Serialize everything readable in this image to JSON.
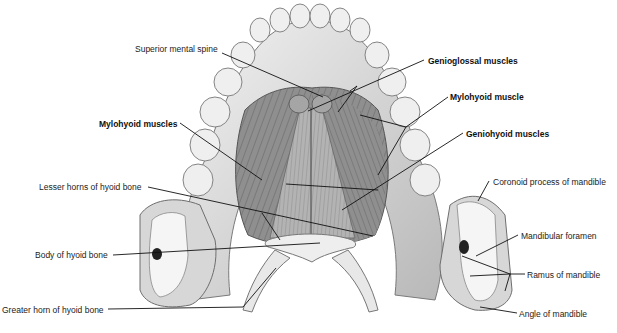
{
  "figure": {
    "labels": [
      {
        "id": "superior-mental-spine",
        "text": "Superior mental spine",
        "bold": false,
        "x": 135,
        "y": 44
      },
      {
        "id": "genioglossal-muscles",
        "text": "Genioglossal muscles",
        "bold": true,
        "x": 428,
        "y": 56
      },
      {
        "id": "mylohyoid-muscle",
        "text": "Mylohyoid muscle",
        "bold": true,
        "x": 450,
        "y": 92
      },
      {
        "id": "mylohyoid-muscles",
        "text": "Mylohyoid muscles",
        "bold": true,
        "x": 99,
        "y": 119
      },
      {
        "id": "geniohyoid-muscles",
        "text": "Geniohyoid muscles",
        "bold": true,
        "x": 466,
        "y": 129
      },
      {
        "id": "lesser-horns-hyoid",
        "text": "Lesser horns of hyoid bone",
        "bold": false,
        "x": 39,
        "y": 182
      },
      {
        "id": "coronoid-process",
        "text": "Coronoid process of mandible",
        "bold": false,
        "x": 493,
        "y": 177
      },
      {
        "id": "mandibular-foramen",
        "text": "Mandibular foramen",
        "bold": false,
        "x": 521,
        "y": 231
      },
      {
        "id": "body-hyoid",
        "text": "Body of hyoid bone",
        "bold": false,
        "x": 35,
        "y": 250
      },
      {
        "id": "ramus-mandible",
        "text": "Ramus of mandible",
        "bold": false,
        "x": 527,
        "y": 270
      },
      {
        "id": "greater-horn-hyoid",
        "text": "Greater horn of hyoid bone",
        "bold": false,
        "x": 2,
        "y": 305
      },
      {
        "id": "angle-mandible",
        "text": "Angle of mandible",
        "bold": false,
        "x": 519,
        "y": 309
      }
    ],
    "colors": {
      "background": "#ffffff",
      "bone": "#e8e8e8",
      "bone_shadow": "#9a9a9a",
      "muscle": "#8c8c8c",
      "muscle_dark": "#5e5e5e",
      "leader": "#111111",
      "text": "#222222"
    }
  }
}
